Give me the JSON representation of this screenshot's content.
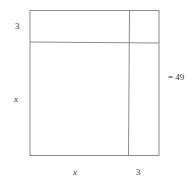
{
  "diagram": {
    "labels": {
      "top_left_side": "3",
      "left_side": "x",
      "bottom_left": "x",
      "bottom_right": "3",
      "right_equation": "= 49"
    },
    "colors": {
      "line": "#8c8c8c",
      "text": "#333333",
      "background": "#ffffff"
    }
  }
}
